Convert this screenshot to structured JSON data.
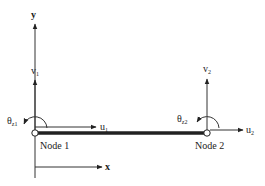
{
  "diagram": {
    "type": "beam-element-dof",
    "axes": {
      "y_label": "y",
      "x_label": "x"
    },
    "nodes": [
      {
        "name": "Node 1",
        "v_label": "v",
        "v_sub": "1",
        "u_label": "u",
        "u_sub": "1",
        "theta_label": "θ",
        "theta_sub": "z1"
      },
      {
        "name": "Node 2",
        "v_label": "v",
        "v_sub": "2",
        "u_label": "u",
        "u_sub": "2",
        "theta_label": "θ",
        "theta_sub": "z2"
      }
    ],
    "colors": {
      "line": "#333333",
      "beam": "#222222",
      "node_fill": "#ffffff"
    }
  }
}
